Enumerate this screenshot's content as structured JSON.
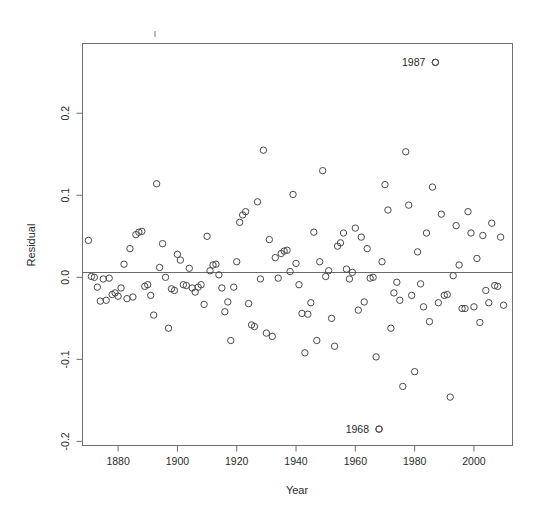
{
  "chart_data": {
    "type": "scatter",
    "title": "",
    "xlabel": "Year",
    "ylabel": "Residual",
    "grid": false,
    "legend": "none",
    "xlim": [
      1868,
      2013
    ],
    "ylim": [
      -0.205,
      0.285
    ],
    "xticks": [
      1880,
      1900,
      1920,
      1940,
      1960,
      1980,
      2000
    ],
    "xtick_labels": [
      "1880",
      "1900",
      "1920",
      "1940",
      "1960",
      "1980",
      "2000"
    ],
    "yticks": [
      0.2,
      0.1,
      0.0,
      -0.1,
      -0.2
    ],
    "ytick_labels": [
      "0.2",
      "0.1",
      "0.0",
      "-0.1",
      "-0.2"
    ],
    "reference_line": {
      "orientation": "horizontal",
      "value": 0.0
    },
    "marker": {
      "shape": "open-circle",
      "radius": 3.2,
      "stroke": "#4a4a4a"
    },
    "annotations": [
      {
        "text": "1987",
        "x": 1987,
        "y": 0.262,
        "placement": "left-of-point"
      },
      {
        "text": "1968",
        "x": 1968,
        "y": -0.185,
        "placement": "left-of-point"
      }
    ],
    "points": [
      [
        1870,
        0.045
      ],
      [
        1871,
        0.001
      ],
      [
        1872,
        0.0
      ],
      [
        1873,
        -0.012
      ],
      [
        1874,
        -0.029
      ],
      [
        1875,
        -0.002
      ],
      [
        1876,
        -0.028
      ],
      [
        1877,
        -0.001
      ],
      [
        1878,
        -0.021
      ],
      [
        1879,
        -0.019
      ],
      [
        1880,
        -0.023
      ],
      [
        1881,
        -0.013
      ],
      [
        1882,
        0.016
      ],
      [
        1883,
        -0.026
      ],
      [
        1884,
        0.035
      ],
      [
        1885,
        -0.024
      ],
      [
        1886,
        0.052
      ],
      [
        1887,
        0.055
      ],
      [
        1888,
        0.056
      ],
      [
        1889,
        -0.011
      ],
      [
        1890,
        -0.009
      ],
      [
        1891,
        -0.022
      ],
      [
        1892,
        -0.046
      ],
      [
        1893,
        0.114
      ],
      [
        1894,
        0.012
      ],
      [
        1895,
        0.041
      ],
      [
        1896,
        0.0
      ],
      [
        1897,
        -0.062
      ],
      [
        1898,
        -0.014
      ],
      [
        1899,
        -0.016
      ],
      [
        1900,
        0.028
      ],
      [
        1901,
        0.021
      ],
      [
        1902,
        -0.009
      ],
      [
        1903,
        -0.01
      ],
      [
        1904,
        0.011
      ],
      [
        1905,
        -0.013
      ],
      [
        1906,
        -0.018
      ],
      [
        1907,
        -0.012
      ],
      [
        1908,
        -0.009
      ],
      [
        1909,
        -0.033
      ],
      [
        1910,
        0.05
      ],
      [
        1911,
        0.008
      ],
      [
        1912,
        0.015
      ],
      [
        1913,
        0.016
      ],
      [
        1914,
        0.003
      ],
      [
        1915,
        -0.013
      ],
      [
        1916,
        -0.042
      ],
      [
        1917,
        -0.03
      ],
      [
        1918,
        -0.077
      ],
      [
        1919,
        -0.012
      ],
      [
        1920,
        0.019
      ],
      [
        1921,
        0.067
      ],
      [
        1922,
        0.076
      ],
      [
        1923,
        0.08
      ],
      [
        1924,
        -0.032
      ],
      [
        1925,
        -0.058
      ],
      [
        1926,
        -0.06
      ],
      [
        1927,
        0.092
      ],
      [
        1928,
        -0.002
      ],
      [
        1929,
        0.155
      ],
      [
        1930,
        -0.068
      ],
      [
        1931,
        0.046
      ],
      [
        1932,
        -0.072
      ],
      [
        1933,
        0.024
      ],
      [
        1934,
        -0.001
      ],
      [
        1935,
        0.029
      ],
      [
        1936,
        0.032
      ],
      [
        1937,
        0.033
      ],
      [
        1938,
        0.007
      ],
      [
        1939,
        0.101
      ],
      [
        1940,
        0.017
      ],
      [
        1941,
        -0.009
      ],
      [
        1942,
        -0.044
      ],
      [
        1943,
        -0.092
      ],
      [
        1944,
        -0.045
      ],
      [
        1945,
        -0.031
      ],
      [
        1946,
        0.055
      ],
      [
        1947,
        -0.077
      ],
      [
        1948,
        0.019
      ],
      [
        1949,
        0.13
      ],
      [
        1950,
        0.001
      ],
      [
        1951,
        0.008
      ],
      [
        1952,
        -0.05
      ],
      [
        1953,
        -0.084
      ],
      [
        1954,
        0.038
      ],
      [
        1955,
        0.042
      ],
      [
        1956,
        0.054
      ],
      [
        1957,
        0.01
      ],
      [
        1958,
        -0.002
      ],
      [
        1959,
        0.006
      ],
      [
        1960,
        0.06
      ],
      [
        1961,
        -0.04
      ],
      [
        1962,
        0.049
      ],
      [
        1963,
        -0.03
      ],
      [
        1964,
        0.035
      ],
      [
        1965,
        -0.001
      ],
      [
        1966,
        0.0
      ],
      [
        1967,
        -0.097
      ],
      [
        1968,
        -0.185
      ],
      [
        1969,
        0.019
      ],
      [
        1970,
        0.113
      ],
      [
        1971,
        0.082
      ],
      [
        1972,
        -0.062
      ],
      [
        1973,
        -0.019
      ],
      [
        1974,
        -0.006
      ],
      [
        1975,
        -0.028
      ],
      [
        1976,
        -0.133
      ],
      [
        1977,
        0.153
      ],
      [
        1978,
        0.088
      ],
      [
        1979,
        -0.022
      ],
      [
        1980,
        -0.115
      ],
      [
        1981,
        0.031
      ],
      [
        1982,
        -0.008
      ],
      [
        1983,
        -0.036
      ],
      [
        1984,
        0.054
      ],
      [
        1985,
        -0.054
      ],
      [
        1986,
        0.11
      ],
      [
        1987,
        0.262
      ],
      [
        1988,
        -0.031
      ],
      [
        1989,
        0.077
      ],
      [
        1990,
        -0.022
      ],
      [
        1991,
        -0.021
      ],
      [
        1992,
        -0.146
      ],
      [
        1993,
        0.002
      ],
      [
        1994,
        0.063
      ],
      [
        1995,
        0.015
      ],
      [
        1996,
        -0.038
      ],
      [
        1997,
        -0.038
      ],
      [
        1998,
        0.08
      ],
      [
        1999,
        0.054
      ],
      [
        2000,
        -0.036
      ],
      [
        2001,
        0.023
      ],
      [
        2002,
        -0.055
      ],
      [
        2003,
        0.051
      ],
      [
        2004,
        -0.016
      ],
      [
        2005,
        -0.031
      ],
      [
        2006,
        0.066
      ],
      [
        2007,
        -0.01
      ],
      [
        2008,
        -0.011
      ],
      [
        2009,
        0.049
      ],
      [
        2010,
        -0.034
      ]
    ]
  }
}
